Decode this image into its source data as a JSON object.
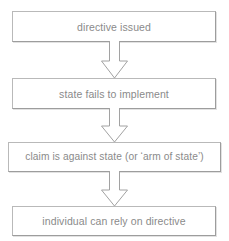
{
  "diagram": {
    "orientation": "vertical",
    "colors": {
      "background": "#ffffff",
      "box_border": "#b9b9b9",
      "text": "#8a8a8a",
      "arrow_stroke": "#a0a0a0"
    },
    "nodes": [
      {
        "id": "node-1",
        "label": "directive issued"
      },
      {
        "id": "node-2",
        "label": "state fails to implement"
      },
      {
        "id": "node-3",
        "label": "claim is against state (or ‘arm of state’)"
      },
      {
        "id": "node-4",
        "label": "individual can rely on directive"
      }
    ],
    "connectors": [
      {
        "id": "arrow-1",
        "icon": "down-block-arrow-icon",
        "from": "node-1",
        "to": "node-2"
      },
      {
        "id": "arrow-2",
        "icon": "down-block-arrow-icon",
        "from": "node-2",
        "to": "node-3"
      },
      {
        "id": "arrow-3",
        "icon": "down-block-arrow-icon",
        "from": "node-3",
        "to": "node-4"
      }
    ]
  }
}
